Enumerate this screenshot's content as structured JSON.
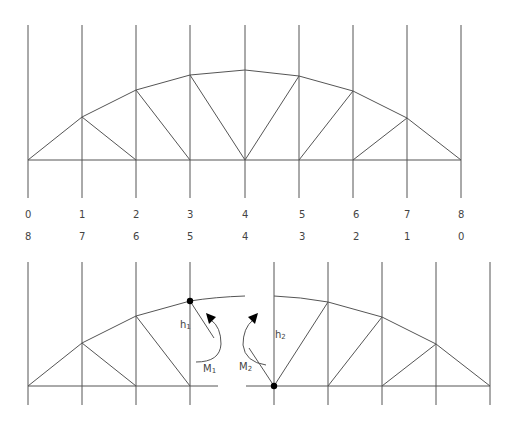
{
  "diagram": {
    "top_labels": [
      "0",
      "1",
      "2",
      "3",
      "4",
      "5",
      "6",
      "7",
      "8"
    ],
    "bottom_labels": [
      "8",
      "7",
      "6",
      "5",
      "4",
      "3",
      "2",
      "1",
      "0"
    ],
    "annotations": {
      "h1": "h",
      "h1_sub": "1",
      "h2": "h",
      "h2_sub": "2",
      "m1": "M",
      "m1_sub": "1",
      "m2": "M",
      "m2_sub": "2"
    },
    "colors": {
      "line": "#555555",
      "node": "#000000",
      "text": "#444444"
    }
  }
}
